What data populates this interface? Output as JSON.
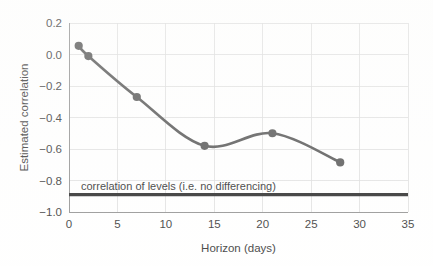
{
  "chart_data": {
    "type": "line",
    "title": "",
    "xlabel": "Horizon (days)",
    "ylabel": "Estimated correlation",
    "xlim": [
      0,
      35
    ],
    "ylim": [
      -1.0,
      0.2
    ],
    "grid": true,
    "legend": "none",
    "xticks": [
      "0",
      "5",
      "10",
      "15",
      "20",
      "25",
      "30",
      "35"
    ],
    "xtick_values": [
      0,
      5,
      10,
      15,
      20,
      25,
      30,
      35
    ],
    "yticks": [
      "0.2",
      "0.0",
      "-0.2",
      "-0.4",
      "-0.6",
      "-0.8",
      "-1.0"
    ],
    "ytick_values": [
      0.2,
      0.0,
      -0.2,
      -0.4,
      -0.6,
      -0.8,
      -1.0
    ],
    "series": [
      {
        "name": "Estimated correlation",
        "x": [
          1,
          2,
          7,
          14,
          21,
          28
        ],
        "values": [
          0.055,
          -0.01,
          -0.27,
          -0.58,
          -0.5,
          -0.685
        ],
        "color": "#4a4a4a",
        "marker": "circle",
        "smooth": true
      }
    ],
    "annotations": [
      {
        "name": "levels-reference-line",
        "type": "hline",
        "y": -0.89,
        "label": "correlation of levels (i.e. no differencing)",
        "color": "#1c1c1c"
      }
    ]
  },
  "axes": {
    "x_axis_label": "Horizon (days)",
    "y_axis_label": "Estimated correlation"
  },
  "colors": {
    "series": "#4a4a4a",
    "reference_line": "#1c1c1c",
    "grid": "#d9d9d9",
    "axis": "#8c8c8c",
    "background": "#ffffff",
    "text": "#2b2b2b"
  }
}
